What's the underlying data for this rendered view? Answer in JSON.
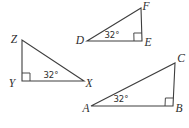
{
  "colors": {
    "background": "#ffffff",
    "line": "#3e3e3e",
    "text": "#2e2e2e"
  },
  "diagram": {
    "stroke_width": 1.1,
    "triangles": [
      {
        "id": "triangle-ZYX",
        "vertices": [
          {
            "label": "Z",
            "x": 22,
            "y": 40,
            "label_x": 14,
            "label_y": 43
          },
          {
            "label": "Y",
            "x": 22,
            "y": 81,
            "label_x": 12,
            "label_y": 87
          },
          {
            "label": "X",
            "x": 84,
            "y": 81,
            "label_x": 89,
            "label_y": 87
          }
        ],
        "right_angle_at": 1,
        "right_angle_size": 8,
        "angle_label": {
          "text": "32°",
          "x": 51,
          "y": 78
        }
      },
      {
        "id": "triangle-DFE",
        "vertices": [
          {
            "label": "D",
            "x": 87,
            "y": 41,
            "label_x": 80,
            "label_y": 44
          },
          {
            "label": "F",
            "x": 141,
            "y": 8,
            "label_x": 146,
            "label_y": 10
          },
          {
            "label": "E",
            "x": 142,
            "y": 41,
            "label_x": 148,
            "label_y": 46
          }
        ],
        "right_angle_at": 2,
        "right_angle_size": 8,
        "angle_label": {
          "text": "32°",
          "x": 112,
          "y": 38
        }
      },
      {
        "id": "triangle-ACB",
        "vertices": [
          {
            "label": "A",
            "x": 91,
            "y": 106,
            "label_x": 86,
            "label_y": 112
          },
          {
            "label": "C",
            "x": 175,
            "y": 63,
            "label_x": 181,
            "label_y": 62
          },
          {
            "label": "B",
            "x": 173,
            "y": 106,
            "label_x": 179,
            "label_y": 112
          }
        ],
        "right_angle_at": 2,
        "right_angle_size": 8,
        "angle_label": {
          "text": "32°",
          "x": 121,
          "y": 102
        }
      }
    ]
  }
}
